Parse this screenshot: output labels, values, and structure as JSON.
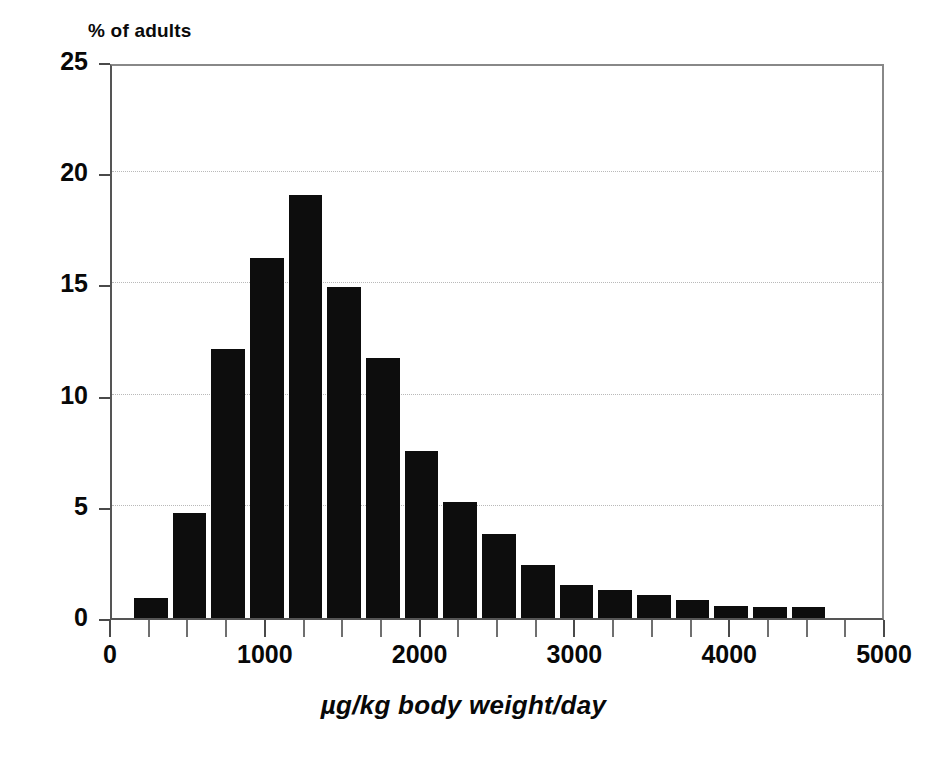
{
  "chart_data": {
    "type": "bar",
    "title": "",
    "subtitle": "",
    "ylabel": "% of adults",
    "xlabel": "µg/kg body weight/day",
    "xlim": [
      0,
      5000
    ],
    "ylim": [
      0,
      25
    ],
    "grid": true,
    "grid_axis": "y",
    "grid_style": "dotted",
    "legend": null,
    "bar_color": "#0d0d0d",
    "bin_width": 250,
    "x_tick_labels": [
      "0",
      "1000",
      "2000",
      "3000",
      "4000",
      "5000"
    ],
    "x_tick_values": [
      0,
      1000,
      2000,
      3000,
      4000,
      5000
    ],
    "x_minor_tick_interval": 250,
    "y_tick_labels": [
      "0",
      "5",
      "10",
      "15",
      "20",
      "25"
    ],
    "y_tick_values": [
      0,
      5,
      10,
      15,
      20,
      25
    ],
    "bins": [
      {
        "x0": 125,
        "x1": 375,
        "center": 250,
        "value": 0.9
      },
      {
        "x0": 375,
        "x1": 625,
        "center": 500,
        "value": 4.7
      },
      {
        "x0": 625,
        "x1": 875,
        "center": 750,
        "value": 12.1
      },
      {
        "x0": 875,
        "x1": 1125,
        "center": 1000,
        "value": 16.2
      },
      {
        "x0": 1125,
        "x1": 1375,
        "center": 1250,
        "value": 19.0
      },
      {
        "x0": 1375,
        "x1": 1625,
        "center": 1500,
        "value": 14.9
      },
      {
        "x0": 1625,
        "x1": 1875,
        "center": 1750,
        "value": 11.7
      },
      {
        "x0": 1875,
        "x1": 2125,
        "center": 2000,
        "value": 7.5
      },
      {
        "x0": 2125,
        "x1": 2375,
        "center": 2250,
        "value": 5.2
      },
      {
        "x0": 2375,
        "x1": 2625,
        "center": 2500,
        "value": 3.8
      },
      {
        "x0": 2625,
        "x1": 2875,
        "center": 2750,
        "value": 2.4
      },
      {
        "x0": 2875,
        "x1": 3125,
        "center": 3000,
        "value": 1.5
      },
      {
        "x0": 3125,
        "x1": 3375,
        "center": 3250,
        "value": 1.25
      },
      {
        "x0": 3375,
        "x1": 3625,
        "center": 3500,
        "value": 1.05
      },
      {
        "x0": 3625,
        "x1": 3875,
        "center": 3750,
        "value": 0.8
      },
      {
        "x0": 3875,
        "x1": 4125,
        "center": 4000,
        "value": 0.55
      },
      {
        "x0": 4125,
        "x1": 4375,
        "center": 4250,
        "value": 0.5
      },
      {
        "x0": 4375,
        "x1": 4625,
        "center": 4500,
        "value": 0.5
      }
    ],
    "categories": [
      250,
      500,
      750,
      1000,
      1250,
      1500,
      1750,
      2000,
      2250,
      2500,
      2750,
      3000,
      3250,
      3500,
      3750,
      4000,
      4250,
      4500
    ],
    "values": [
      0.9,
      4.7,
      12.1,
      16.2,
      19.0,
      14.9,
      11.7,
      7.5,
      5.2,
      3.8,
      2.4,
      1.5,
      1.25,
      1.05,
      0.8,
      0.55,
      0.5,
      0.5
    ]
  }
}
